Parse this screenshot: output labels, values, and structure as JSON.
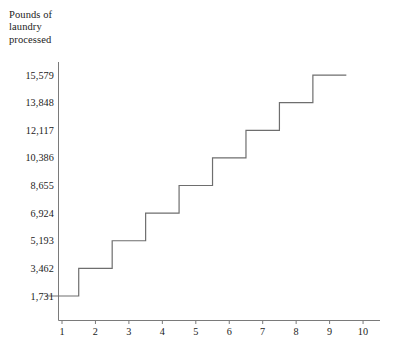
{
  "chart_data": {
    "type": "line",
    "subtype": "step",
    "title": "",
    "ylabel": "Pounds of\nlaundry\nprocessed",
    "xlabel": "",
    "x": [
      1,
      2,
      3,
      4,
      5,
      6,
      7,
      8,
      9
    ],
    "values": [
      1731,
      3462,
      5193,
      6924,
      8655,
      10386,
      12117,
      13848,
      15579
    ],
    "step_mode": "mid",
    "ytick_labels": [
      "1,731",
      "3,462",
      "5,193",
      "6,924",
      "8,655",
      "10,386",
      "12,117",
      "13,848",
      "15,579"
    ],
    "ytick_values": [
      1731,
      3462,
      5193,
      6924,
      8655,
      10386,
      12117,
      13848,
      15579
    ],
    "xtick_labels": [
      "1",
      "2",
      "3",
      "4",
      "5",
      "6",
      "7",
      "8",
      "9",
      "10"
    ],
    "xtick_values": [
      1,
      2,
      3,
      4,
      5,
      6,
      7,
      8,
      9,
      10
    ],
    "xlim": [
      0.5,
      10.6
    ],
    "ylim": [
      0,
      16750
    ],
    "grid": false,
    "legend": null,
    "line_color": "#6e6e6e",
    "axis_color": "#7a7a7a",
    "text_color": "#1b1b1b",
    "background": "#ffffff"
  },
  "axes": {
    "y_title": "Pounds of\nlaundry\nprocessed"
  }
}
